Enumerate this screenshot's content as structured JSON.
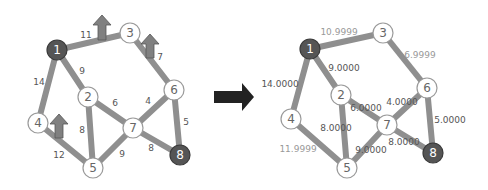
{
  "transition_arrow": {
    "direction": "right",
    "color": "#222222"
  },
  "left_graph": {
    "nodes": [
      {
        "id": "1",
        "label": "1",
        "dark": true
      },
      {
        "id": "2",
        "label": "2",
        "dark": false
      },
      {
        "id": "3",
        "label": "3",
        "dark": false
      },
      {
        "id": "4",
        "label": "4",
        "dark": false
      },
      {
        "id": "5",
        "label": "5",
        "dark": false
      },
      {
        "id": "6",
        "label": "6",
        "dark": false
      },
      {
        "id": "7",
        "label": "7",
        "dark": false
      },
      {
        "id": "8",
        "label": "8",
        "dark": true
      }
    ],
    "edges": [
      {
        "from": "1",
        "to": "3",
        "weight": "11"
      },
      {
        "from": "1",
        "to": "2",
        "weight": "9"
      },
      {
        "from": "1",
        "to": "4",
        "weight": "14"
      },
      {
        "from": "3",
        "to": "6",
        "weight": "7"
      },
      {
        "from": "2",
        "to": "7",
        "weight": "6"
      },
      {
        "from": "2",
        "to": "5",
        "weight": "8"
      },
      {
        "from": "6",
        "to": "7",
        "weight": "4"
      },
      {
        "from": "6",
        "to": "8",
        "weight": "5"
      },
      {
        "from": "4",
        "to": "5",
        "weight": "12"
      },
      {
        "from": "7",
        "to": "5",
        "weight": "9"
      },
      {
        "from": "7",
        "to": "8",
        "weight": "8"
      }
    ],
    "up_arrows_on_edges": [
      "1-3",
      "3-6",
      "4-5"
    ]
  },
  "right_graph": {
    "nodes": [
      {
        "id": "1",
        "label": "1",
        "dark": true
      },
      {
        "id": "2",
        "label": "2",
        "dark": false
      },
      {
        "id": "3",
        "label": "3",
        "dark": false
      },
      {
        "id": "4",
        "label": "4",
        "dark": false
      },
      {
        "id": "5",
        "label": "5",
        "dark": false
      },
      {
        "id": "6",
        "label": "6",
        "dark": false
      },
      {
        "id": "7",
        "label": "7",
        "dark": false
      },
      {
        "id": "8",
        "label": "8",
        "dark": true
      }
    ],
    "edges": [
      {
        "from": "1",
        "to": "3",
        "weight": "10.9999"
      },
      {
        "from": "1",
        "to": "2",
        "weight": "9.0000"
      },
      {
        "from": "1",
        "to": "4",
        "weight": "14.0000"
      },
      {
        "from": "3",
        "to": "6",
        "weight": "6.9999"
      },
      {
        "from": "2",
        "to": "7",
        "weight": "6.0000"
      },
      {
        "from": "2",
        "to": "5",
        "weight": "8.0000"
      },
      {
        "from": "6",
        "to": "7",
        "weight": "4.0000"
      },
      {
        "from": "6",
        "to": "8",
        "weight": "5.0000"
      },
      {
        "from": "4",
        "to": "5",
        "weight": "11.9999"
      },
      {
        "from": "7",
        "to": "5",
        "weight": "9.0000"
      },
      {
        "from": "7",
        "to": "8",
        "weight": "8.0000"
      }
    ]
  }
}
